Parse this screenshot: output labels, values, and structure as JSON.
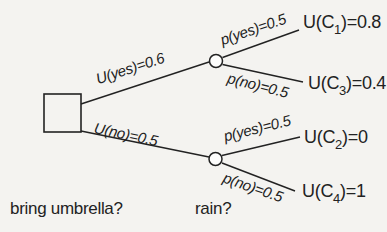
{
  "colors": {
    "background": "#f4f3f0",
    "ink": "#222222"
  },
  "diagram": {
    "type": "decision-tree",
    "decision_branches": {
      "yes_label": "U(yes)=0.6",
      "no_label": "U(no)=0.5"
    },
    "chance_branches": {
      "top": {
        "yes_label": "p(yes)=0.5",
        "no_label": "p(no)=0.5"
      },
      "bottom": {
        "yes_label": "p(yes)=0.5",
        "no_label": "p(no)=0.5"
      }
    },
    "outcomes": {
      "c1": {
        "pre": "U(C",
        "sub": "1",
        "post": ")=0.8"
      },
      "c3": {
        "pre": "U(C",
        "sub": "3",
        "post": ")=0.4"
      },
      "c2": {
        "pre": "U(C",
        "sub": "2",
        "post": ")=0"
      },
      "c4": {
        "pre": "U(C",
        "sub": "4",
        "post": ")=1"
      }
    },
    "captions": {
      "decision": "bring umbrella?",
      "chance": "rain?"
    }
  }
}
